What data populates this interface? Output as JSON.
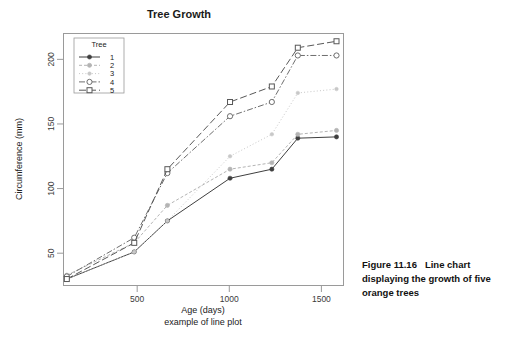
{
  "figure": {
    "caption_number": "Figure 11.16",
    "caption_text": "Line chart displaying the growth of five orange trees"
  },
  "chart_data": {
    "type": "line",
    "title": "Tree Growth",
    "xlabel": "Age (days)",
    "sublabel": "example of line plot",
    "ylabel": "Circumference (mm)",
    "xlim": [
      100,
      1620
    ],
    "ylim": [
      25,
      220
    ],
    "xticks": [
      500,
      1000,
      1500
    ],
    "yticks": [
      50,
      100,
      150,
      200
    ],
    "grid": false,
    "legend_title": "Tree",
    "legend_position": "top-left-inside",
    "x": [
      118,
      484,
      664,
      1004,
      1231,
      1372,
      1582
    ],
    "series": [
      {
        "name": "1",
        "label": "1",
        "color": "#3f3f3f",
        "dash": "none",
        "marker": "filled-circle",
        "values": [
          30,
          51,
          75,
          108,
          115,
          139,
          140
        ]
      },
      {
        "name": "2",
        "label": "2",
        "color": "#b4b4b4",
        "dash": "dashed-fine",
        "marker": "filled-circle",
        "values": [
          33,
          58,
          87,
          115,
          120,
          142,
          145
        ]
      },
      {
        "name": "3",
        "label": "3",
        "color": "#c8c8c8",
        "dash": "dotted",
        "marker": "small-circle",
        "values": [
          30,
          51,
          75,
          125,
          142,
          174,
          177
        ]
      },
      {
        "name": "4",
        "label": "4",
        "color": "#6e6e6e",
        "dash": "dash-dot",
        "marker": "open-circle",
        "values": [
          32,
          62,
          112,
          156,
          167,
          203,
          203
        ]
      },
      {
        "name": "5",
        "label": "5",
        "color": "#585858",
        "dash": "long-dash",
        "marker": "open-square",
        "values": [
          30,
          49,
          81,
          125,
          142,
          174,
          177
        ]
      }
    ],
    "series_overrides": {
      "note": "series 5 plotted with square markers along upper trace",
      "series5_values": [
        30,
        58,
        115,
        167,
        179,
        209,
        214
      ]
    },
    "colors": {
      "frame": "#9a9a9a",
      "axis_text": "#3a3a3a",
      "title": "#1a1a1a",
      "background": "#ffffff"
    }
  }
}
